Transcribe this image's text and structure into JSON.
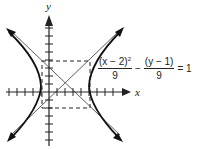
{
  "diagram": {
    "type": "hyperbola-graph",
    "axes": {
      "x_label": "x",
      "y_label": "y",
      "tick_spacing_px": 8
    },
    "equation": {
      "term1_numerator": "(x − 2)",
      "term1_exponent": "2",
      "term1_denominator": "9",
      "operator": "−",
      "term2_numerator": "(y − 1)",
      "term2_denominator": "9",
      "equals": "= 1"
    },
    "features": {
      "center": [
        2,
        1
      ],
      "asymptotes": 2,
      "branches": [
        "left",
        "right"
      ],
      "reference_box": "dashed rectangle"
    },
    "colors": {
      "ink": "#222222",
      "background": "#ffffff"
    }
  }
}
